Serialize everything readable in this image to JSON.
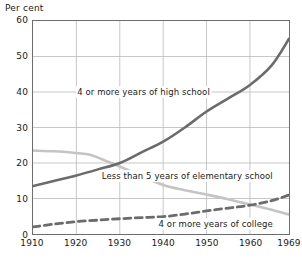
{
  "chart_data": {
    "type": "line",
    "title": "",
    "subtitle": "",
    "xlabel": "",
    "ylabel": "Per cent",
    "xlim": [
      1910,
      1969
    ],
    "ylim": [
      0,
      60
    ],
    "grid": true,
    "grid_color": "#b8b8b8",
    "axis_color": "#6d6d6d",
    "legend_position": "inline-annotations",
    "x_ticks": [
      1910,
      1920,
      1930,
      1940,
      1950,
      1960,
      1969
    ],
    "x_tick_labels": [
      "1910",
      "1920",
      "1930",
      "1940",
      "1950",
      "1960",
      "1969"
    ],
    "y_ticks": [
      0,
      10,
      20,
      30,
      40,
      50,
      60
    ],
    "y_tick_labels": [
      "0",
      "10",
      "20",
      "30",
      "40",
      "50",
      "60"
    ],
    "series": [
      {
        "name": "4 or more years of high school",
        "style": "solid",
        "color": "#6b6b6b",
        "width": 2.6,
        "annotation": "4 or more years of high school",
        "x": [
          1910,
          1920,
          1930,
          1940,
          1950,
          1960,
          1969
        ],
        "values": [
          13.5,
          16.5,
          19.8,
          26.0,
          34.5,
          42.0,
          55.0
        ],
        "points": [
          {
            "x": 1910,
            "y": 13.5
          },
          {
            "x": 1915,
            "y": 15.0
          },
          {
            "x": 1920,
            "y": 16.5
          },
          {
            "x": 1925,
            "y": 18.2
          },
          {
            "x": 1930,
            "y": 20.0
          },
          {
            "x": 1935,
            "y": 23.0
          },
          {
            "x": 1940,
            "y": 26.0
          },
          {
            "x": 1945,
            "y": 30.0
          },
          {
            "x": 1950,
            "y": 34.5
          },
          {
            "x": 1955,
            "y": 38.2
          },
          {
            "x": 1960,
            "y": 42.0
          },
          {
            "x": 1965,
            "y": 47.5
          },
          {
            "x": 1969,
            "y": 55.0
          }
        ]
      },
      {
        "name": "Less than 5 years of elementary school",
        "style": "solid",
        "color": "#c4c4c4",
        "width": 2.6,
        "annotation": "Less than 5 years of elementary school",
        "x": [
          1910,
          1920,
          1930,
          1940,
          1950,
          1960,
          1969
        ],
        "values": [
          23.5,
          22.8,
          19.0,
          13.8,
          11.1,
          8.3,
          5.5
        ],
        "points": [
          {
            "x": 1910,
            "y": 23.5
          },
          {
            "x": 1915,
            "y": 23.3
          },
          {
            "x": 1920,
            "y": 22.8
          },
          {
            "x": 1923,
            "y": 22.4
          },
          {
            "x": 1926,
            "y": 21.0
          },
          {
            "x": 1930,
            "y": 19.0
          },
          {
            "x": 1935,
            "y": 16.4
          },
          {
            "x": 1940,
            "y": 13.8
          },
          {
            "x": 1945,
            "y": 12.3
          },
          {
            "x": 1950,
            "y": 11.1
          },
          {
            "x": 1955,
            "y": 9.8
          },
          {
            "x": 1960,
            "y": 8.3
          },
          {
            "x": 1965,
            "y": 6.8
          },
          {
            "x": 1969,
            "y": 5.5
          }
        ]
      },
      {
        "name": "4 or more years of college",
        "style": "dashed",
        "color": "#6b6b6b",
        "width": 2.8,
        "annotation": "4 or more years of college",
        "x": [
          1910,
          1920,
          1930,
          1940,
          1950,
          1960,
          1969
        ],
        "values": [
          2.0,
          3.5,
          4.3,
          4.9,
          6.5,
          8.1,
          11.0
        ],
        "points": [
          {
            "x": 1910,
            "y": 2.0
          },
          {
            "x": 1915,
            "y": 2.8
          },
          {
            "x": 1920,
            "y": 3.5
          },
          {
            "x": 1925,
            "y": 3.9
          },
          {
            "x": 1930,
            "y": 4.3
          },
          {
            "x": 1935,
            "y": 4.6
          },
          {
            "x": 1940,
            "y": 4.9
          },
          {
            "x": 1945,
            "y": 5.6
          },
          {
            "x": 1950,
            "y": 6.5
          },
          {
            "x": 1955,
            "y": 7.3
          },
          {
            "x": 1960,
            "y": 8.1
          },
          {
            "x": 1965,
            "y": 9.4
          },
          {
            "x": 1969,
            "y": 11.0
          }
        ]
      }
    ],
    "annotations": [
      {
        "text": "4 or more years of high school",
        "x": 1935.5,
        "y": 40.0
      },
      {
        "text": "Less than 5 years of elementary school",
        "x": 1945.5,
        "y": 16.5
      },
      {
        "text": "4 or more years of college",
        "x": 1952.0,
        "y": 3.0
      }
    ]
  }
}
